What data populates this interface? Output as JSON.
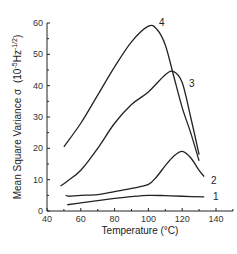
{
  "chart_data": {
    "type": "line",
    "title": "",
    "xlabel": "Temperature (°C)",
    "ylabel": "Mean Square Variance σ (10⁻⁵Hz⁻¹ᐟ²)",
    "xlim": [
      40,
      150
    ],
    "ylim": [
      0,
      60
    ],
    "xticks": [
      40,
      60,
      80,
      100,
      120,
      140
    ],
    "yticks": [
      0,
      10,
      20,
      30,
      40,
      50,
      60
    ],
    "grid": false,
    "legend": "inline curve labels",
    "series": [
      {
        "name": "1",
        "x": [
          52,
          60,
          70,
          80,
          90,
          100,
          110,
          120,
          133
        ],
        "y": [
          2,
          2.6,
          3.3,
          4.0,
          4.6,
          5.0,
          4.9,
          4.7,
          4.5
        ]
      },
      {
        "name": "2",
        "x": [
          51,
          53,
          60,
          70,
          80,
          90,
          100,
          105,
          110,
          115,
          120,
          125,
          130,
          133
        ],
        "y": [
          5,
          4.7,
          5.0,
          5.2,
          6.2,
          7.2,
          8.5,
          11,
          14.5,
          17.5,
          19,
          17,
          13,
          11
        ]
      },
      {
        "name": "3",
        "x": [
          48,
          52,
          60,
          70,
          80,
          90,
          100,
          110,
          115,
          120,
          125,
          130
        ],
        "y": [
          8,
          9.5,
          13,
          20,
          28,
          34,
          38,
          43.5,
          44.5,
          41,
          30,
          18
        ]
      },
      {
        "name": "4",
        "x": [
          50,
          60,
          70,
          80,
          90,
          100,
          105,
          110,
          115,
          120,
          125,
          130
        ],
        "y": [
          20.5,
          28,
          37,
          46,
          54,
          59,
          58,
          53,
          43,
          33,
          25,
          16
        ]
      }
    ]
  },
  "axes": {
    "x_title": "Temperature (°C)",
    "y_title_main": "Mean Square Variance σ",
    "y_title_units": "(10",
    "y_title_exp1": "-5",
    "y_title_mid": "Hz",
    "y_title_exp2": "-1/2",
    "y_title_close": ")",
    "x_ticks": [
      "40",
      "60",
      "80",
      "100",
      "120",
      "140"
    ],
    "y_ticks": [
      "0",
      "10",
      "20",
      "30",
      "40",
      "50",
      "60"
    ]
  },
  "curve_labels": [
    "1",
    "2",
    "3",
    "4"
  ]
}
